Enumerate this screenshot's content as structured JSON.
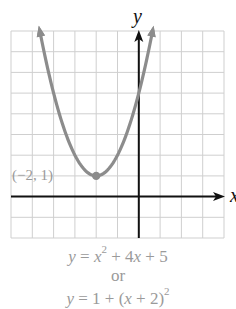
{
  "chart_data": {
    "type": "line",
    "title": "",
    "xlabel": "x",
    "ylabel": "y",
    "xlim": [
      -6,
      4
    ],
    "ylim": [
      -2,
      8
    ],
    "grid": true,
    "legend": null,
    "series": [
      {
        "name": "y = x^2 + 4x + 5",
        "function": "x^2 + 4x + 5",
        "x": [
          -4.65,
          -4,
          -3,
          -2,
          -1,
          0,
          0.65
        ],
        "y": [
          8,
          5,
          2,
          1,
          2,
          5,
          8
        ],
        "color": "#8c8c8c"
      }
    ],
    "annotations": [
      {
        "label": "(−2, 1)",
        "x": -2,
        "y": 1,
        "type": "vertex-point"
      }
    ]
  },
  "labels": {
    "x_axis": "x",
    "y_axis": "y",
    "vertex": "(−2, 1)"
  },
  "equations": {
    "line1": {
      "y": "y",
      "eq": " = ",
      "x": "x",
      "exp": "2",
      "rest": " + 4",
      "x2": "x",
      "tail": " + 5"
    },
    "or": "or",
    "line3": {
      "y": "y",
      "eq": " = 1 + (",
      "x": "x",
      "rest": " + 2)",
      "exp": "2"
    }
  },
  "colors": {
    "grid": "#cfcfcf",
    "axis": "#111111",
    "curve": "#8c8c8c",
    "label_gray": "#9a9a9a"
  }
}
